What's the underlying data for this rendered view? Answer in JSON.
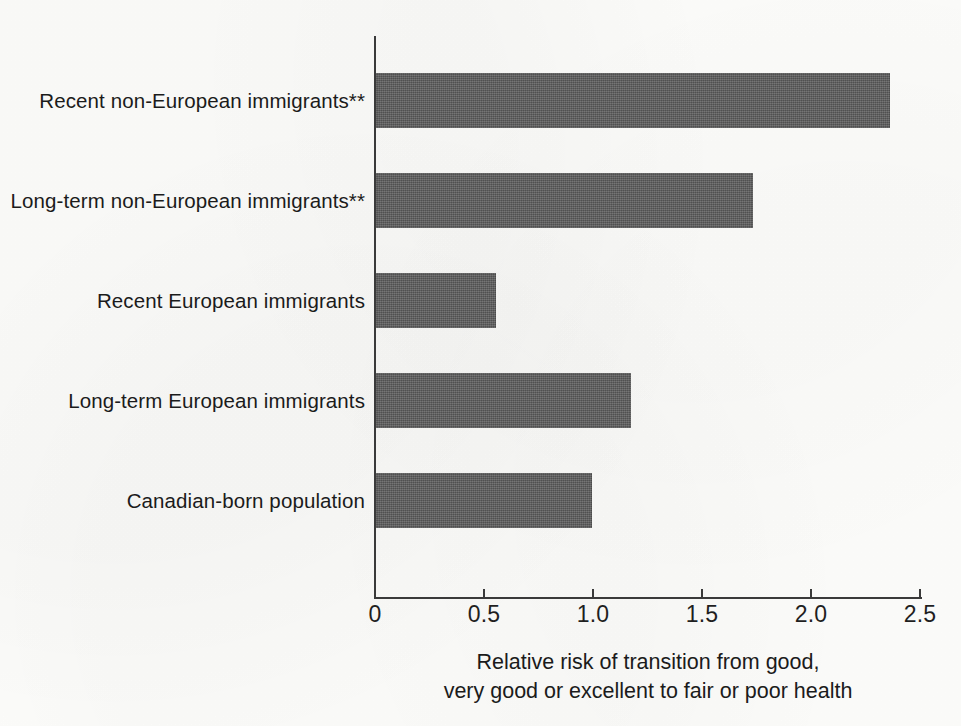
{
  "chart_data": {
    "type": "bar",
    "orientation": "horizontal",
    "title": "",
    "subtitle": "",
    "xlabel_lines": [
      "Relative risk of transition from good,",
      "very good or excellent to fair or poor health"
    ],
    "ylabel": "",
    "categories": [
      "Recent non-European immigrants**",
      "Long-term non-European immigrants**",
      "Recent European immigrants",
      "Long-term European immigrants",
      "Canadian-born population"
    ],
    "values": [
      2.36,
      1.73,
      0.55,
      1.17,
      0.99
    ],
    "xlim": [
      0,
      2.5
    ],
    "xticks": [
      0,
      0.5,
      1.0,
      1.5,
      2.0,
      2.5
    ],
    "xtick_labels": [
      "0",
      "0.5",
      "1.0",
      "1.5",
      "2.0",
      "2.5"
    ],
    "grid": false,
    "legend": null,
    "bar_color": "#5b5b5b",
    "axis_color": "#3a3a3a",
    "background_color": "#fdfdfb"
  }
}
